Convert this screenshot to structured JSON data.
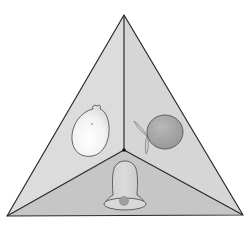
{
  "diagram": {
    "title": "Triangular pyramid viewed from above with objects on three faces",
    "colors": {
      "background": "#ffffff",
      "face_left": "#dcdcdc",
      "face_right": "#d6d6d6",
      "face_bottom": "#c6c6c6",
      "edge": "#2a2a2a",
      "lemon_fill": "#f4f4f4",
      "orange_fill": "#a9a9a9",
      "leaf_fill": "#cfcfcf",
      "bell_fill": "#d2d2d2",
      "clapper_fill": "#a0a0a0"
    },
    "vertices": {
      "apex": [
        124,
        15
      ],
      "bottom_left": [
        7,
        216
      ],
      "bottom_right": [
        243,
        215
      ],
      "center": [
        124,
        150
      ]
    },
    "faces": [
      {
        "name": "left-face",
        "object": "lemon"
      },
      {
        "name": "right-face",
        "object": "orange with leaves"
      },
      {
        "name": "bottom-face",
        "object": "bell"
      }
    ]
  }
}
